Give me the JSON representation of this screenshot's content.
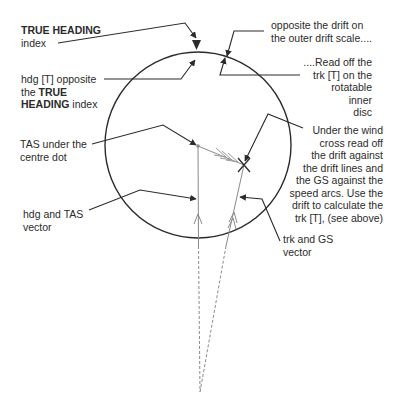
{
  "diagram": {
    "colors": {
      "ink": "#2b2b2b",
      "vector": "#8a8a8a",
      "background": "#ffffff"
    },
    "labels": {
      "true_heading_bold": "TRUE HEADING",
      "true_heading_rest": "index",
      "hdg_opposite_1": "hdg [T] opposite",
      "hdg_opposite_2a": "the ",
      "hdg_opposite_2b": "TRUE",
      "hdg_opposite_3a": "HEADING",
      "hdg_opposite_3b": " index",
      "tas_centre_1": "TAS under the",
      "tas_centre_2": "centre dot",
      "hdg_tas_vector_1": "hdg and TAS",
      "hdg_tas_vector_2": "vector",
      "drift_outer_1": "opposite the drift on",
      "drift_outer_2": "the outer drift scale....",
      "read_trk_1": "....Read off the",
      "read_trk_2": "trk [T] on the",
      "read_trk_3": "rotatable",
      "read_trk_4": "inner",
      "read_trk_5": "disc",
      "wind_cross_1": "Under the wind",
      "wind_cross_2": "cross read off",
      "wind_cross_3": "the drift against",
      "wind_cross_4": "the drift lines and",
      "wind_cross_5": "the GS against the",
      "wind_cross_6": "speed arcs. Use the",
      "wind_cross_7": "drift to calculate the",
      "wind_cross_8": "trk [T], (see above)",
      "trk_gs_vector_1": "trk and GS",
      "trk_gs_vector_2": "vector"
    },
    "elements": {
      "inner_disc": {
        "cx": 198,
        "cy": 145,
        "r": 93
      },
      "centre_dot": {
        "x": 198,
        "y": 146
      },
      "wind_cross": {
        "x": 244,
        "y": 165
      },
      "vector_origin": {
        "x": 200,
        "y": 392
      },
      "heading_index": {
        "x": 196,
        "y": 44
      }
    }
  }
}
